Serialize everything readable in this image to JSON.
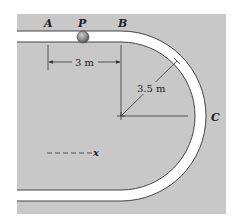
{
  "diagram": {
    "colors": {
      "background": "#c8c8c8",
      "track": "#ffffff",
      "track_edge": "#444444",
      "ball": "#8a8a8a",
      "line": "#333333"
    },
    "points": {
      "A": "A",
      "P": "P",
      "B": "B",
      "C": "C"
    },
    "dimensions": {
      "straight_length": "3 m",
      "radius": "3.5 m"
    },
    "axis": {
      "label": "x"
    }
  }
}
